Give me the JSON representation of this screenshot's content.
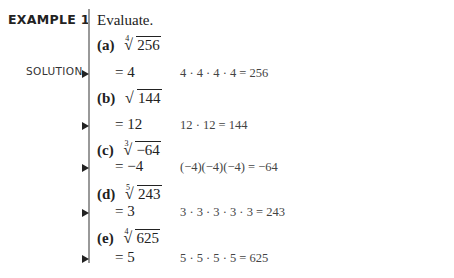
{
  "header": {
    "example_label": "EXAMPLE 1",
    "instruction": "Evaluate.",
    "solution_label": "SOLUTION"
  },
  "parts": [
    {
      "label": "(a)",
      "index": "4",
      "radicand": "256",
      "answer": "= 4",
      "check": "4 · 4 · 4 · 4 = 256"
    },
    {
      "label": "(b)",
      "index": "",
      "radicand": "144",
      "answer": "= 12",
      "check": "12 · 12 = 144"
    },
    {
      "label": "(c)",
      "index": "3",
      "radicand": "−64",
      "answer": "= −4",
      "check": "(−4)(−4)(−4) = −64"
    },
    {
      "label": "(d)",
      "index": "5",
      "radicand": "243",
      "answer": "= 3",
      "check": "3 · 3 · 3 · 3 · 3 = 243"
    },
    {
      "label": "(e)",
      "index": "4",
      "radicand": "625",
      "answer": "= 5",
      "check": "5 · 5 · 5 · 5 = 625"
    }
  ],
  "icons": {
    "solution_arrow": "right-triangle-arrow"
  }
}
